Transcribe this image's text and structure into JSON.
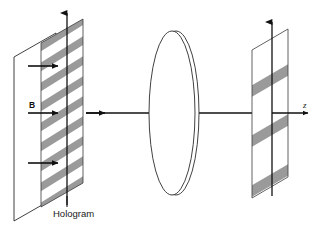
{
  "figure": {
    "background_color": "#ffffff",
    "stripe_color": "#9a9a9a",
    "line_color": "#111111",
    "lens_edge_color": "#a8a8a8"
  },
  "labels": {
    "hologram": "Hologram",
    "b_field": "B",
    "z_axis": "z"
  },
  "elements": {
    "back_plate_name": "back-reference-plate",
    "hologram_plate_name": "hologram-grating-plate",
    "lens_name": "converging-lens",
    "output_plate_name": "output-fringe-plate",
    "optical_axis_name": "optical-axis-ray",
    "incoming_rays_count": 3,
    "hologram_stripe_count": 9,
    "output_stripe_count": 3
  }
}
